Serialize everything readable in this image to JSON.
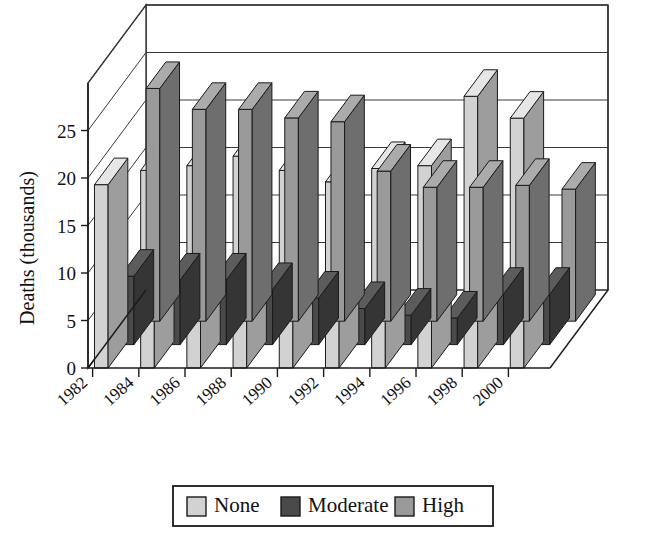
{
  "chart_data": {
    "type": "bar",
    "title": "",
    "subtitle": "",
    "xlabel": "",
    "ylabel": "Deaths (thousands)",
    "ylim": [
      0,
      30
    ],
    "ytick_values": [
      0,
      5,
      10,
      15,
      20,
      25
    ],
    "ytick_labels": [
      "0",
      "5",
      "10",
      "15",
      "20",
      "25"
    ],
    "gridlines": true,
    "grid_axis": "y",
    "projection": "3d-bars",
    "legend_position": "bottom",
    "categories": [
      "1982",
      "1984",
      "1986",
      "1988",
      "1990",
      "1992",
      "1994",
      "1996",
      "1998",
      "2000"
    ],
    "series": [
      {
        "name": "None",
        "color": "#d2d2d2",
        "values": [
          19.3,
          20.8,
          21.3,
          22.3,
          20.8,
          19.6,
          21.0,
          21.3,
          28.6,
          26.3
        ]
      },
      {
        "name": "Moderate",
        "color": "#4a4a4a",
        "values": [
          7.2,
          6.8,
          6.8,
          5.8,
          4.9,
          3.8,
          3.1,
          2.8,
          5.3,
          5.3
        ]
      },
      {
        "name": "High",
        "color": "#9a9a9a",
        "values": [
          24.5,
          22.3,
          22.3,
          21.4,
          21.0,
          15.8,
          14.1,
          14.1,
          14.3,
          13.9
        ]
      }
    ]
  },
  "legend": {
    "entries": [
      {
        "label": "None",
        "swatch_color": "#d2d2d2"
      },
      {
        "label": "Moderate",
        "swatch_color": "#4a4a4a"
      },
      {
        "label": "High",
        "swatch_color": "#9a9a9a"
      }
    ]
  },
  "axes": {
    "y_title": "Deaths (thousands)",
    "y_ticks": [
      "0",
      "5",
      "10",
      "15",
      "20",
      "25"
    ],
    "x_ticks": [
      "1982",
      "1984",
      "1986",
      "1988",
      "1990",
      "1992",
      "1994",
      "1996",
      "1998",
      "2000"
    ]
  },
  "colors": {
    "none_front": "#d2d2d2",
    "none_top": "#e6e6e6",
    "none_side": "#9d9d9d",
    "moderate_front": "#4a4a4a",
    "moderate_top": "#5c5c5c",
    "moderate_side": "#353535",
    "high_front": "#9a9a9a",
    "high_top": "#ababab",
    "high_side": "#6e6e6e",
    "outline": "#1a1a1a",
    "background": "#ffffff"
  }
}
